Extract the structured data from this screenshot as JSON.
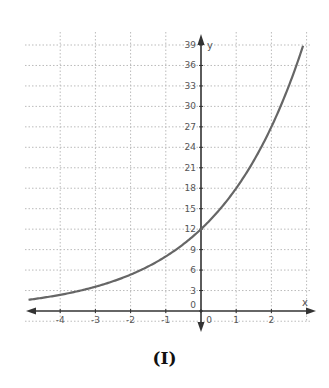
{
  "caption": "(I)",
  "chart_data": {
    "type": "line",
    "title": "",
    "xlabel": "x",
    "ylabel": "y",
    "xlim": [
      -5,
      3
    ],
    "ylim": [
      0,
      40
    ],
    "x_ticks": [
      -4,
      -3,
      -2,
      -1,
      0,
      1,
      2
    ],
    "y_ticks": [
      0,
      3,
      6,
      9,
      12,
      15,
      18,
      21,
      24,
      27,
      30,
      33,
      36,
      39
    ],
    "grid": true,
    "function": "y = 12 * 1.5^x",
    "series": [
      {
        "name": "f(x)",
        "x": [
          -4.9,
          -4,
          -3,
          -2,
          -1,
          0,
          1,
          2,
          2.9
        ],
        "y": [
          1.65,
          2.37,
          3.56,
          5.33,
          8.0,
          12.0,
          18.0,
          27.0,
          38.9
        ]
      }
    ],
    "colors": {
      "curve": "#666666",
      "axis": "#333333",
      "grid": "#bbbbbb"
    }
  }
}
